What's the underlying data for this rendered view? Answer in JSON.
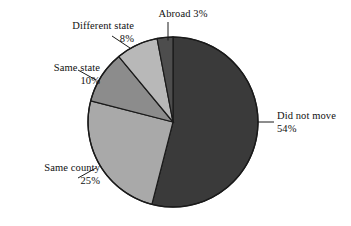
{
  "chart_data": {
    "type": "pie",
    "title": "",
    "subtitle": "",
    "xlabel": "",
    "ylabel": "",
    "legend_position": "none",
    "grid": false,
    "start_angle_deg": 0,
    "direction": "clockwise",
    "categories": [
      "Did not move",
      "Same county",
      "Same state",
      "Different state",
      "Abroad"
    ],
    "values": [
      54,
      25,
      10,
      8,
      3
    ],
    "value_suffix": "%",
    "slices": [
      {
        "name": "Did not move",
        "label": "Did not move",
        "value": 54,
        "value_label": "54%",
        "color": "#3a3a3a",
        "label_align": "left",
        "label_placement": "right"
      },
      {
        "name": "Same county",
        "label": "Same county",
        "value": 25,
        "value_label": "25%",
        "color": "#a9a9a9",
        "label_align": "right",
        "label_placement": "lower-left"
      },
      {
        "name": "Same state",
        "label": "Same state",
        "value": 10,
        "value_label": "10%",
        "color": "#8c8c8c",
        "label_align": "right",
        "label_placement": "left"
      },
      {
        "name": "Different state",
        "label": "Different state",
        "value": 8,
        "value_label": "8%",
        "color": "#b8b8b8",
        "label_align": "right",
        "label_placement": "upper-left"
      },
      {
        "name": "Abroad",
        "label": "Abroad",
        "value": 3,
        "value_label": "3%",
        "color": "#4d4d4d",
        "label_align": "center",
        "label_placement": "top"
      }
    ],
    "outline_color": "#1a1a1a",
    "leader_line_color": "#1a1a1a",
    "background_color": "#ffffff"
  },
  "labels": {
    "abroad": {
      "text": "Abroad 3%",
      "line1": "Abroad 3%",
      "line2": ""
    },
    "different_state": {
      "line1": "Different state",
      "line2": "8%"
    },
    "same_state": {
      "line1": "Same state",
      "line2": "10%"
    },
    "same_county": {
      "line1": "Same county",
      "line2": "25%"
    },
    "did_not_move": {
      "line1": "Did not move",
      "line2": "54%"
    }
  }
}
